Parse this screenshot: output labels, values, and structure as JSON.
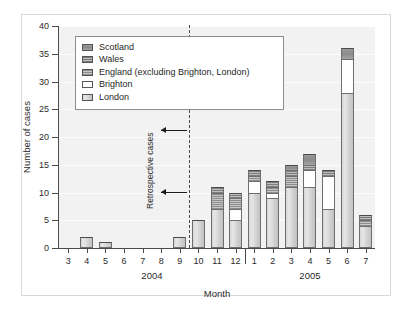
{
  "chart_data": {
    "type": "bar",
    "title": "",
    "xlabel": "Month",
    "ylabel": "Number of cases",
    "ylim": [
      0,
      40
    ],
    "yticks": [
      0,
      5,
      10,
      15,
      20,
      25,
      30,
      35,
      40
    ],
    "grid": true,
    "stacked": true,
    "legend_position": "upper-left-inside",
    "categories": [
      "3",
      "4",
      "5",
      "6",
      "7",
      "8",
      "9",
      "10",
      "11",
      "12",
      "1",
      "2",
      "3",
      "4",
      "5",
      "6",
      "7"
    ],
    "year_groups": [
      {
        "label": "2004",
        "categories": [
          "3",
          "4",
          "5",
          "6",
          "7",
          "8",
          "9",
          "10",
          "11",
          "12"
        ]
      },
      {
        "label": "2005",
        "categories": [
          "1",
          "2",
          "3",
          "4",
          "5",
          "6",
          "7"
        ]
      }
    ],
    "series": [
      {
        "name": "London",
        "values": [
          0,
          2,
          1,
          0,
          0,
          0,
          2,
          5,
          7,
          5,
          10,
          9,
          11,
          11,
          7,
          28,
          4
        ]
      },
      {
        "name": "Brighton",
        "values": [
          0,
          0,
          0,
          0,
          0,
          0,
          0,
          0,
          0,
          2,
          2,
          1,
          0,
          3,
          6,
          6,
          0
        ]
      },
      {
        "name": "England (excluding Brighton, London)",
        "values": [
          0,
          0,
          0,
          0,
          0,
          0,
          0,
          0,
          3,
          2,
          1,
          1,
          2,
          0,
          0,
          0,
          1
        ]
      },
      {
        "name": "Wales",
        "values": [
          0,
          0,
          0,
          0,
          0,
          0,
          0,
          0,
          1,
          1,
          1,
          1,
          1,
          1,
          1,
          0,
          1
        ]
      },
      {
        "name": "Scotland",
        "values": [
          0,
          0,
          0,
          0,
          0,
          0,
          0,
          0,
          0,
          0,
          0,
          0,
          1,
          2,
          0,
          2,
          0
        ]
      }
    ],
    "totals": [
      0,
      2,
      1,
      0,
      0,
      0,
      2,
      5,
      11,
      10,
      14,
      12,
      15,
      17,
      14,
      36,
      6
    ],
    "annotations": [
      {
        "text": "Retrospective cases",
        "orientation": "vertical",
        "arrows": 2,
        "marker": "dashed vertical line between month 9 and month 10 of 2004"
      }
    ]
  },
  "legend": {
    "items": [
      {
        "label": "Scotland",
        "swatch": "scotland-swatch",
        "color": "#9a9a9a"
      },
      {
        "label": "Wales",
        "swatch": "wales-swatch",
        "color": "#7d7d7d"
      },
      {
        "label": "England (excluding Brighton, London)",
        "swatch": "england-swatch",
        "color": "#8c8c8c"
      },
      {
        "label": "Brighton",
        "swatch": "brighton-swatch",
        "color": "#ffffff"
      },
      {
        "label": "London",
        "swatch": "london-swatch",
        "color": "#d6d6d6"
      }
    ]
  },
  "axes": {
    "y_title": "Number of cases",
    "x_title": "Month",
    "y_tick_labels": [
      "0",
      "5",
      "10",
      "15",
      "20",
      "25",
      "30",
      "35",
      "40"
    ],
    "x_tick_labels": [
      "3",
      "4",
      "5",
      "6",
      "7",
      "8",
      "9",
      "10",
      "11",
      "12",
      "1",
      "2",
      "3",
      "4",
      "5",
      "6",
      "7"
    ],
    "year_labels": [
      "2004",
      "2005"
    ]
  },
  "annotation": {
    "retrospective_label": "Retrospective cases"
  },
  "colors": {
    "plot_background": "#f2f2f2",
    "axis": "#4a4a4a",
    "frame": "#d9d9d9",
    "page_background": "#ffffff"
  }
}
